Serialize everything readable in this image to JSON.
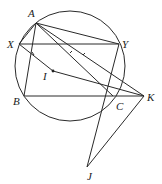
{
  "diagram": {
    "type": "geometry",
    "circle": {
      "cx": 70,
      "cy": 66,
      "r": 55
    },
    "points": {
      "A": {
        "x": 36,
        "y": 23,
        "label": "A",
        "lx": 28,
        "ly": 17
      },
      "X": {
        "x": 19,
        "y": 44,
        "label": "X",
        "lx": 8,
        "ly": 48
      },
      "Y": {
        "x": 119,
        "y": 44,
        "label": "Y",
        "lx": 122,
        "ly": 48
      },
      "B": {
        "x": 24,
        "y": 96,
        "label": "B",
        "lx": 13,
        "ly": 104
      },
      "C": {
        "x": 113,
        "y": 96,
        "label": "C",
        "lx": 116,
        "ly": 110
      },
      "K": {
        "x": 144,
        "y": 96,
        "label": "K",
        "lx": 147,
        "ly": 101
      },
      "J": {
        "x": 87,
        "y": 167,
        "label": "J",
        "lx": 87,
        "ly": 180
      },
      "I": {
        "x": 53,
        "y": 71,
        "label": "I",
        "lx": 42,
        "ly": 80
      }
    },
    "segments": [
      [
        "A",
        "X"
      ],
      [
        "A",
        "Y"
      ],
      [
        "A",
        "B"
      ],
      [
        "X",
        "Y"
      ],
      [
        "B",
        "K"
      ],
      [
        "A",
        "C"
      ],
      [
        "A",
        "K"
      ],
      [
        "X",
        "K"
      ],
      [
        "Y",
        "J"
      ],
      [
        "K",
        "J"
      ]
    ]
  }
}
